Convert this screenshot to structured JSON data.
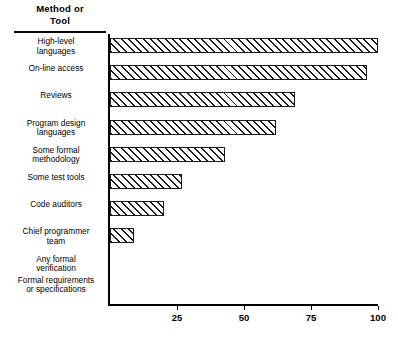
{
  "header": {
    "line1": "Method  or",
    "line2": "Tool"
  },
  "chart_data": {
    "type": "bar",
    "orientation": "horizontal",
    "title": "",
    "subtitle": "",
    "xlabel": "",
    "ylabel": "Method  or Tool",
    "xlim": [
      0,
      100
    ],
    "ylim": null,
    "grid": false,
    "legend": null,
    "xticks": [
      25,
      50,
      75,
      100
    ],
    "xticklabels": [
      "25",
      "50",
      "75",
      "100"
    ],
    "categories": [
      "High-level\nlanguages",
      "On-line access",
      "Reviews",
      "Program design\nlanguages",
      "Some  formal\nmethodology",
      "Some test tools",
      "Code auditors",
      "Chief programmer\nteam",
      "Any  formal\nverification",
      "Formal requirements\nor specifications"
    ],
    "values": [
      100,
      96,
      69,
      62,
      43,
      27,
      20,
      9,
      0,
      0
    ],
    "bar_style": {
      "fill": "diagonal-hatch",
      "hatch_color": "#1a1a1a",
      "background": "#ffffff",
      "edge_color": "#1a1a1a"
    }
  }
}
